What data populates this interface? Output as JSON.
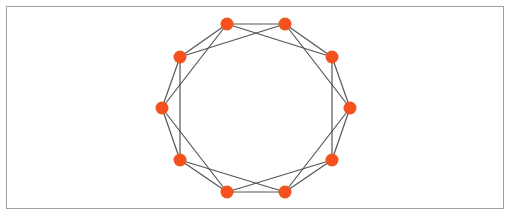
{
  "diagram": {
    "type": "circulant-graph",
    "node_color": "#F4511E",
    "edge_color": "#555555",
    "border_color": "#a0a0a0",
    "node_radius": 6.5,
    "nodes": [
      {
        "id": 0,
        "x": 227,
        "y": 24
      },
      {
        "id": 1,
        "x": 285,
        "y": 24
      },
      {
        "id": 2,
        "x": 332,
        "y": 57
      },
      {
        "id": 3,
        "x": 350,
        "y": 108
      },
      {
        "id": 4,
        "x": 332,
        "y": 160
      },
      {
        "id": 5,
        "x": 285,
        "y": 192
      },
      {
        "id": 6,
        "x": 227,
        "y": 192
      },
      {
        "id": 7,
        "x": 180,
        "y": 160
      },
      {
        "id": 8,
        "x": 162,
        "y": 108
      },
      {
        "id": 9,
        "x": 180,
        "y": 57
      }
    ],
    "edges": [
      [
        0,
        1
      ],
      [
        1,
        2
      ],
      [
        2,
        3
      ],
      [
        3,
        4
      ],
      [
        4,
        5
      ],
      [
        5,
        6
      ],
      [
        6,
        7
      ],
      [
        7,
        8
      ],
      [
        8,
        9
      ],
      [
        9,
        0
      ],
      [
        0,
        2
      ],
      [
        1,
        3
      ],
      [
        2,
        4
      ],
      [
        3,
        5
      ],
      [
        4,
        6
      ],
      [
        5,
        7
      ],
      [
        6,
        8
      ],
      [
        7,
        9
      ],
      [
        8,
        0
      ],
      [
        9,
        1
      ]
    ]
  }
}
